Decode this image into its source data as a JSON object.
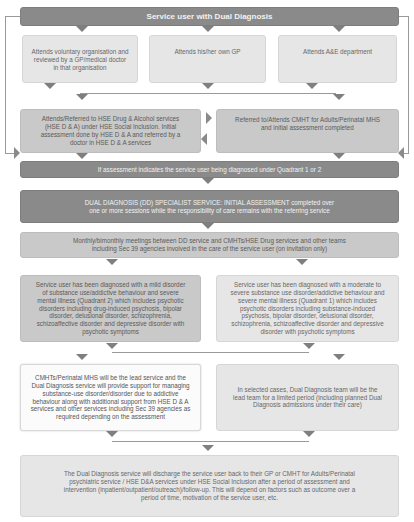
{
  "diagram": {
    "title": "Service user with Dual Diagnosis",
    "entry_points": [
      {
        "label": "Attends voluntary organisation and reviewed by a GP/medical doctor in that organisation"
      },
      {
        "label": "Attends his/her own GP"
      },
      {
        "label": "Attends A&E department"
      }
    ],
    "referrals": [
      {
        "label": "Attends/Referred to HSE Drug & Alcohol services (HSE D & A) under HSE Social Inclusion. Initial assessment done by HSE D & A and referred by a doctor in HSE D & A services"
      },
      {
        "label": "Referred to/Attends CMHT for Adults/Perinatal MHS and initial assessment completed"
      }
    ],
    "quadrant_check": "If assessment indicates the service user being diagnosed under Quadrant 1 or 2",
    "specialist_assessment": "DUAL DIAGNOSIS (DD) SPECIALIST SERVICE: INITIAL ASSESSMENT completed over one or more sessions while the responsibility of care remains with the referring service",
    "meetings": "Monthly/bimonthly meetings between DD service and CMHTs/HSE Drug services and other teams including Sec 39 agencies involved in the care of the service user (on invitation only)",
    "diagnoses": [
      {
        "label": "Service user has been diagnosed with a mild disorder of substance use/addictive behaviour and severe mental illness (Quadrant 2) which includes psychotic disorders including drug-induced psychosis, bipolar disorder, delusional disorder, schizophrenia, schizoaffective disorder and depressive disorder with psychotic symptoms"
      },
      {
        "label": "Service user has been diagnosed with a moderate to severe substance use disorder/addictive behaviour and severe mental illness (Quadrant 1) which includes psychotic disorders including substance-induced psychosis, bipolar disorder, delusional disorder, schizophrenia, schizoaffective disorder and depressive disorder with psychotic symptoms"
      }
    ],
    "care_leads": [
      {
        "label": "CMHTs/Perinatal MHS will be the lead service and the Dual Diagnosis service will provide support for managing substance-use disorder/disorder due to addictive behaviour along with additional support from HSE D & A services and other services including Sec 39 agencies as required depending on the assessment"
      },
      {
        "label": "In selected cases, Dual Diagnosis team will be the lead team for a limited period (including planned Dual Diagnosis admissions under their care)"
      }
    ],
    "discharge": "The Dual Diagnosis service will discharge the service user back to their GP or CMHT for Adults/Perinatal psychiatric service / HSE D&A services under HSE Social Inclusion after a period of assessment and intervention (inpatient/outpatient/outreach)/follow-up. This will depend on factors such as outcome over a period of time, motivation of the service user, etc."
  },
  "colors": {
    "dark_box": "#8a8a8a",
    "mid_box": "#c9c9c9",
    "light_box": "#e6e6e6",
    "white_box": "#fbfbfb",
    "arrow": "#7f7f7f"
  }
}
